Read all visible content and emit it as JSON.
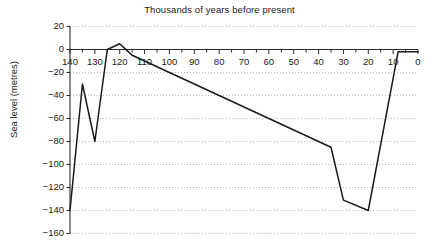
{
  "chart_data": {
    "type": "line",
    "title": "Thousands of years before present",
    "xlabel": "",
    "ylabel": "Sea level (metres)",
    "xlim": [
      140,
      0
    ],
    "ylim": [
      -160,
      20
    ],
    "x_reversed": true,
    "grid": true,
    "grid_style": "dotted-horizontal",
    "legend": "none",
    "x_ticks": [
      140,
      130,
      120,
      110,
      100,
      90,
      80,
      70,
      60,
      50,
      40,
      30,
      20,
      10,
      0
    ],
    "x_tick_labels": [
      "140",
      "130",
      "120",
      "110",
      "100",
      "90",
      "80",
      "70",
      "60",
      "50",
      "40",
      "30",
      "20",
      "10",
      "0"
    ],
    "x_minor_tick_step": 5,
    "y_ticks": [
      20,
      0,
      -20,
      -40,
      -60,
      -80,
      -100,
      -120,
      -140,
      -160
    ],
    "y_tick_labels": [
      "20",
      "0",
      "−20",
      "−40",
      "−60",
      "−80",
      "−100",
      "−120",
      "−140",
      "−160"
    ],
    "series": [
      {
        "name": "Sea level",
        "color": "#1a1a1a",
        "x": [
          140,
          135,
          130,
          125,
          120,
          117,
          115,
          35,
          30,
          20,
          8,
          7,
          0
        ],
        "y": [
          -140,
          -30,
          -80,
          0,
          5,
          -1,
          -5,
          -85,
          -131,
          -140,
          -2,
          -2,
          -2
        ]
      }
    ]
  },
  "axis": {
    "x_axis_position_value": 0,
    "y_axis_position_value": 140
  }
}
